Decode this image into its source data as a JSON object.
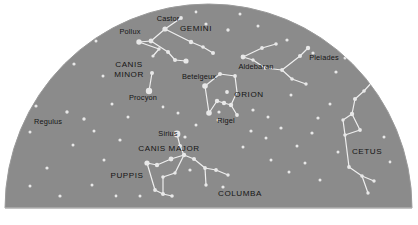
{
  "chart_data": {
    "type": "scatter",
    "subtitle": "",
    "xlabel": "",
    "ylabel": "",
    "xlim": [
      0,
      418
    ],
    "ylim": [
      0,
      225
    ],
    "grid": false,
    "legend_position": "none",
    "projection": "half-dome horizon view",
    "colors": {
      "background": "#ffffff",
      "sky": "#8b8b8b",
      "sky_edge": "#9a9a9a",
      "baseline": "#b9b9b9",
      "star": "#e8e8e8",
      "constellation_line": "#efefef",
      "label": "#151515"
    },
    "dome": {
      "left_x": 5,
      "right_x": 412,
      "top_y": 4,
      "baseline_y": 208
    },
    "star_labels": [
      {
        "name": "Castor",
        "x": 168,
        "y": 21,
        "anchor": "middle"
      },
      {
        "name": "Pollux",
        "x": 130,
        "y": 34,
        "anchor": "middle"
      },
      {
        "name": "Betelgeux",
        "x": 199,
        "y": 79,
        "anchor": "middle"
      },
      {
        "name": "Aldebaran",
        "x": 256,
        "y": 69,
        "anchor": "middle"
      },
      {
        "name": "Procyon",
        "x": 143,
        "y": 100,
        "anchor": "middle"
      },
      {
        "name": "Regulus",
        "x": 48,
        "y": 124,
        "anchor": "middle"
      },
      {
        "name": "Sirius",
        "x": 168,
        "y": 136,
        "anchor": "middle"
      },
      {
        "name": "Rigel",
        "x": 226,
        "y": 123,
        "anchor": "middle"
      },
      {
        "name": "Pleiades",
        "x": 324,
        "y": 60,
        "anchor": "middle"
      }
    ],
    "constellation_labels": [
      {
        "name": "GEMINI",
        "x": 196,
        "y": 31,
        "anchor": "middle",
        "lines": [
          "GEMINI"
        ]
      },
      {
        "name": "CANIS MINOR",
        "x": 129,
        "y": 67,
        "anchor": "middle",
        "lines": [
          "CANIS",
          "MINOR"
        ]
      },
      {
        "name": "ORION",
        "x": 249,
        "y": 97,
        "anchor": "middle",
        "lines": [
          "ORION"
        ]
      },
      {
        "name": "CANIS MAJOR",
        "x": 169,
        "y": 151,
        "anchor": "middle",
        "lines": [
          "CANIS MAJOR"
        ]
      },
      {
        "name": "PUPPIS",
        "x": 127,
        "y": 178,
        "anchor": "middle",
        "lines": [
          "PUPPIS"
        ]
      },
      {
        "name": "COLUMBA",
        "x": 240,
        "y": 196,
        "anchor": "middle",
        "lines": [
          "COLUMBA"
        ]
      },
      {
        "name": "CETUS",
        "x": 367,
        "y": 154,
        "anchor": "middle",
        "lines": [
          "CETUS"
        ]
      }
    ],
    "stars": [
      {
        "x": 165,
        "y": 29,
        "r": 2.6
      },
      {
        "x": 151,
        "y": 41,
        "r": 2.4
      },
      {
        "x": 139,
        "y": 42,
        "r": 2.7
      },
      {
        "x": 181,
        "y": 18,
        "r": 1.9
      },
      {
        "x": 191,
        "y": 42,
        "r": 2.2
      },
      {
        "x": 203,
        "y": 47,
        "r": 1.8
      },
      {
        "x": 213,
        "y": 53,
        "r": 2.0
      },
      {
        "x": 168,
        "y": 52,
        "r": 2.0
      },
      {
        "x": 175,
        "y": 60,
        "r": 2.0
      },
      {
        "x": 186,
        "y": 61,
        "r": 2.6
      },
      {
        "x": 159,
        "y": 49,
        "r": 1.7
      },
      {
        "x": 153,
        "y": 56,
        "r": 1.6
      },
      {
        "x": 152,
        "y": 73,
        "r": 2.0
      },
      {
        "x": 149,
        "y": 91,
        "r": 3.2
      },
      {
        "x": 205,
        "y": 86,
        "r": 2.8
      },
      {
        "x": 220,
        "y": 74,
        "r": 2.0
      },
      {
        "x": 235,
        "y": 76,
        "r": 1.9
      },
      {
        "x": 227,
        "y": 92,
        "r": 1.9
      },
      {
        "x": 217,
        "y": 101,
        "r": 2.2
      },
      {
        "x": 224,
        "y": 103,
        "r": 2.2
      },
      {
        "x": 231,
        "y": 105,
        "r": 2.2
      },
      {
        "x": 209,
        "y": 113,
        "r": 2.8
      },
      {
        "x": 237,
        "y": 115,
        "r": 1.9
      },
      {
        "x": 219,
        "y": 112,
        "r": 1.6
      },
      {
        "x": 218,
        "y": 120,
        "r": 1.5
      },
      {
        "x": 243,
        "y": 57,
        "r": 2.4
      },
      {
        "x": 262,
        "y": 48,
        "r": 1.9
      },
      {
        "x": 276,
        "y": 44,
        "r": 1.8
      },
      {
        "x": 253,
        "y": 60,
        "r": 1.7
      },
      {
        "x": 265,
        "y": 68,
        "r": 1.7
      },
      {
        "x": 282,
        "y": 70,
        "r": 1.9
      },
      {
        "x": 292,
        "y": 79,
        "r": 1.8
      },
      {
        "x": 306,
        "y": 84,
        "r": 1.7
      },
      {
        "x": 300,
        "y": 56,
        "r": 2.0
      },
      {
        "x": 308,
        "y": 48,
        "r": 2.2
      },
      {
        "x": 313,
        "y": 53,
        "r": 1.6
      },
      {
        "x": 287,
        "y": 40,
        "r": 1.6
      },
      {
        "x": 177,
        "y": 134,
        "r": 3.4
      },
      {
        "x": 185,
        "y": 137,
        "r": 1.6
      },
      {
        "x": 180,
        "y": 146,
        "r": 2.0
      },
      {
        "x": 171,
        "y": 159,
        "r": 2.4
      },
      {
        "x": 184,
        "y": 155,
        "r": 2.2
      },
      {
        "x": 194,
        "y": 159,
        "r": 2.0
      },
      {
        "x": 157,
        "y": 165,
        "r": 2.2
      },
      {
        "x": 147,
        "y": 163,
        "r": 2.6
      },
      {
        "x": 163,
        "y": 177,
        "r": 1.8
      },
      {
        "x": 175,
        "y": 173,
        "r": 1.7
      },
      {
        "x": 155,
        "y": 190,
        "r": 1.9
      },
      {
        "x": 163,
        "y": 194,
        "r": 2.0
      },
      {
        "x": 172,
        "y": 196,
        "r": 1.8
      },
      {
        "x": 190,
        "y": 170,
        "r": 1.6
      },
      {
        "x": 205,
        "y": 168,
        "r": 1.9
      },
      {
        "x": 216,
        "y": 170,
        "r": 1.9
      },
      {
        "x": 228,
        "y": 175,
        "r": 1.7
      },
      {
        "x": 206,
        "y": 185,
        "r": 1.7
      },
      {
        "x": 223,
        "y": 187,
        "r": 1.6
      },
      {
        "x": 352,
        "y": 114,
        "r": 2.2
      },
      {
        "x": 360,
        "y": 130,
        "r": 1.9
      },
      {
        "x": 345,
        "y": 135,
        "r": 1.8
      },
      {
        "x": 343,
        "y": 120,
        "r": 1.7
      },
      {
        "x": 355,
        "y": 99,
        "r": 2.0
      },
      {
        "x": 364,
        "y": 91,
        "r": 1.8
      },
      {
        "x": 374,
        "y": 80,
        "r": 1.7
      },
      {
        "x": 349,
        "y": 167,
        "r": 1.9
      },
      {
        "x": 362,
        "y": 176,
        "r": 1.8
      },
      {
        "x": 374,
        "y": 181,
        "r": 1.7
      },
      {
        "x": 368,
        "y": 193,
        "r": 1.7
      },
      {
        "x": 96,
        "y": 41,
        "r": 1.5
      },
      {
        "x": 74,
        "y": 64,
        "r": 1.6
      },
      {
        "x": 103,
        "y": 76,
        "r": 1.5
      },
      {
        "x": 67,
        "y": 112,
        "r": 1.7
      },
      {
        "x": 36,
        "y": 106,
        "r": 1.6
      },
      {
        "x": 30,
        "y": 132,
        "r": 1.5
      },
      {
        "x": 84,
        "y": 119,
        "r": 1.7
      },
      {
        "x": 73,
        "y": 145,
        "r": 1.5
      },
      {
        "x": 47,
        "y": 168,
        "r": 1.6
      },
      {
        "x": 30,
        "y": 186,
        "r": 1.5
      },
      {
        "x": 60,
        "y": 196,
        "r": 1.6
      },
      {
        "x": 92,
        "y": 185,
        "r": 1.5
      },
      {
        "x": 104,
        "y": 160,
        "r": 1.5
      },
      {
        "x": 120,
        "y": 140,
        "r": 1.6
      },
      {
        "x": 128,
        "y": 117,
        "r": 1.5
      },
      {
        "x": 112,
        "y": 104,
        "r": 1.5
      },
      {
        "x": 94,
        "y": 131,
        "r": 1.5
      },
      {
        "x": 251,
        "y": 131,
        "r": 1.6
      },
      {
        "x": 266,
        "y": 138,
        "r": 1.5
      },
      {
        "x": 281,
        "y": 128,
        "r": 1.6
      },
      {
        "x": 297,
        "y": 146,
        "r": 1.5
      },
      {
        "x": 312,
        "y": 133,
        "r": 1.6
      },
      {
        "x": 271,
        "y": 160,
        "r": 1.5
      },
      {
        "x": 289,
        "y": 172,
        "r": 1.5
      },
      {
        "x": 305,
        "y": 163,
        "r": 1.5
      },
      {
        "x": 320,
        "y": 180,
        "r": 1.5
      },
      {
        "x": 253,
        "y": 110,
        "r": 1.6
      },
      {
        "x": 268,
        "y": 117,
        "r": 1.5
      },
      {
        "x": 330,
        "y": 104,
        "r": 1.5
      },
      {
        "x": 318,
        "y": 118,
        "r": 1.6
      },
      {
        "x": 336,
        "y": 72,
        "r": 1.6
      },
      {
        "x": 345,
        "y": 58,
        "r": 1.5
      },
      {
        "x": 206,
        "y": 24,
        "r": 1.6
      },
      {
        "x": 228,
        "y": 30,
        "r": 1.7
      },
      {
        "x": 240,
        "y": 14,
        "r": 1.5
      },
      {
        "x": 258,
        "y": 26,
        "r": 1.5
      },
      {
        "x": 196,
        "y": 12,
        "r": 1.4
      },
      {
        "x": 291,
        "y": 95,
        "r": 1.5
      },
      {
        "x": 243,
        "y": 147,
        "r": 1.5
      },
      {
        "x": 338,
        "y": 152,
        "r": 1.5
      },
      {
        "x": 384,
        "y": 137,
        "r": 1.5
      },
      {
        "x": 390,
        "y": 162,
        "r": 1.4
      },
      {
        "x": 178,
        "y": 113,
        "r": 1.5
      },
      {
        "x": 163,
        "y": 107,
        "r": 1.4
      },
      {
        "x": 196,
        "y": 125,
        "r": 1.5
      },
      {
        "x": 140,
        "y": 196,
        "r": 1.5
      },
      {
        "x": 116,
        "y": 196,
        "r": 1.4
      }
    ],
    "constellation_lines": [
      {
        "from": [
          181,
          18
        ],
        "to": [
          165,
          29
        ]
      },
      {
        "from": [
          165,
          29
        ],
        "to": [
          151,
          41
        ]
      },
      {
        "from": [
          151,
          41
        ],
        "to": [
          139,
          42
        ]
      },
      {
        "from": [
          165,
          29
        ],
        "to": [
          191,
          42
        ]
      },
      {
        "from": [
          191,
          42
        ],
        "to": [
          203,
          47
        ]
      },
      {
        "from": [
          203,
          47
        ],
        "to": [
          213,
          53
        ]
      },
      {
        "from": [
          151,
          41
        ],
        "to": [
          168,
          52
        ]
      },
      {
        "from": [
          168,
          52
        ],
        "to": [
          175,
          60
        ]
      },
      {
        "from": [
          175,
          60
        ],
        "to": [
          186,
          61
        ]
      },
      {
        "from": [
          139,
          42
        ],
        "to": [
          159,
          49
        ]
      },
      {
        "from": [
          159,
          49
        ],
        "to": [
          153,
          56
        ]
      },
      {
        "from": [
          152,
          73
        ],
        "to": [
          149,
          91
        ]
      },
      {
        "from": [
          205,
          86
        ],
        "to": [
          220,
          74
        ]
      },
      {
        "from": [
          220,
          74
        ],
        "to": [
          235,
          76
        ]
      },
      {
        "from": [
          235,
          76
        ],
        "to": [
          237,
          92
        ]
      },
      {
        "from": [
          205,
          86
        ],
        "to": [
          209,
          113
        ]
      },
      {
        "from": [
          217,
          101
        ],
        "to": [
          224,
          103
        ]
      },
      {
        "from": [
          224,
          103
        ],
        "to": [
          231,
          105
        ]
      },
      {
        "from": [
          209,
          113
        ],
        "to": [
          217,
          101
        ]
      },
      {
        "from": [
          231,
          105
        ],
        "to": [
          237,
          115
        ]
      },
      {
        "from": [
          237,
          92
        ],
        "to": [
          231,
          105
        ]
      },
      {
        "from": [
          243,
          57
        ],
        "to": [
          262,
          48
        ]
      },
      {
        "from": [
          262,
          48
        ],
        "to": [
          276,
          44
        ]
      },
      {
        "from": [
          243,
          57
        ],
        "to": [
          253,
          60
        ]
      },
      {
        "from": [
          253,
          60
        ],
        "to": [
          265,
          68
        ]
      },
      {
        "from": [
          265,
          68
        ],
        "to": [
          282,
          70
        ]
      },
      {
        "from": [
          282,
          70
        ],
        "to": [
          292,
          79
        ]
      },
      {
        "from": [
          292,
          79
        ],
        "to": [
          306,
          84
        ]
      },
      {
        "from": [
          282,
          70
        ],
        "to": [
          300,
          56
        ]
      },
      {
        "from": [
          300,
          56
        ],
        "to": [
          308,
          48
        ]
      },
      {
        "from": [
          177,
          134
        ],
        "to": [
          180,
          146
        ]
      },
      {
        "from": [
          180,
          146
        ],
        "to": [
          184,
          155
        ]
      },
      {
        "from": [
          184,
          155
        ],
        "to": [
          171,
          159
        ]
      },
      {
        "from": [
          184,
          155
        ],
        "to": [
          194,
          159
        ]
      },
      {
        "from": [
          171,
          159
        ],
        "to": [
          157,
          165
        ]
      },
      {
        "from": [
          157,
          165
        ],
        "to": [
          147,
          163
        ]
      },
      {
        "from": [
          184,
          155
        ],
        "to": [
          175,
          173
        ]
      },
      {
        "from": [
          175,
          173
        ],
        "to": [
          163,
          177
        ]
      },
      {
        "from": [
          163,
          177
        ],
        "to": [
          163,
          194
        ]
      },
      {
        "from": [
          147,
          163
        ],
        "to": [
          155,
          190
        ]
      },
      {
        "from": [
          155,
          190
        ],
        "to": [
          163,
          194
        ]
      },
      {
        "from": [
          163,
          194
        ],
        "to": [
          172,
          196
        ]
      },
      {
        "from": [
          194,
          159
        ],
        "to": [
          205,
          168
        ]
      },
      {
        "from": [
          205,
          168
        ],
        "to": [
          216,
          170
        ]
      },
      {
        "from": [
          216,
          170
        ],
        "to": [
          228,
          175
        ]
      },
      {
        "from": [
          205,
          168
        ],
        "to": [
          206,
          185
        ]
      },
      {
        "from": [
          352,
          114
        ],
        "to": [
          355,
          99
        ]
      },
      {
        "from": [
          355,
          99
        ],
        "to": [
          364,
          91
        ]
      },
      {
        "from": [
          364,
          91
        ],
        "to": [
          374,
          80
        ]
      },
      {
        "from": [
          352,
          114
        ],
        "to": [
          343,
          120
        ]
      },
      {
        "from": [
          343,
          120
        ],
        "to": [
          345,
          135
        ]
      },
      {
        "from": [
          345,
          135
        ],
        "to": [
          360,
          130
        ]
      },
      {
        "from": [
          360,
          130
        ],
        "to": [
          352,
          114
        ]
      },
      {
        "from": [
          345,
          135
        ],
        "to": [
          349,
          167
        ]
      },
      {
        "from": [
          349,
          167
        ],
        "to": [
          362,
          176
        ]
      },
      {
        "from": [
          362,
          176
        ],
        "to": [
          374,
          181
        ]
      },
      {
        "from": [
          362,
          176
        ],
        "to": [
          368,
          193
        ]
      }
    ]
  }
}
